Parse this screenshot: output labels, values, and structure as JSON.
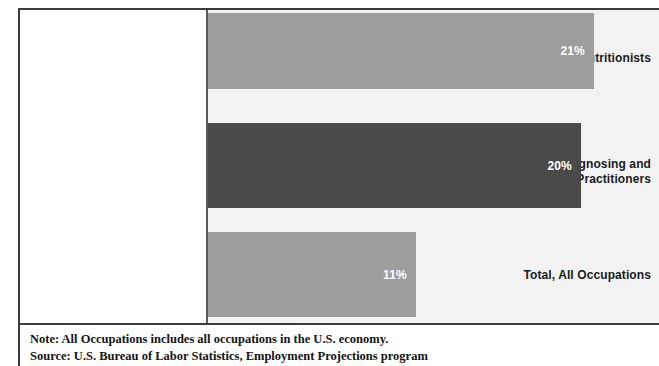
{
  "chart_data": {
    "type": "bar",
    "orientation": "horizontal",
    "title": "",
    "xlabel": "",
    "ylabel": "",
    "grid": false,
    "legend": "none",
    "xlim": [
      0,
      25
    ],
    "categories": [
      "Dietitians and Nutritionists",
      "Health Diagnosing and Treating Practitioners",
      "Total, All Occupations"
    ],
    "values": [
      21,
      20,
      11
    ],
    "value_labels": [
      "21%",
      "20%",
      "11%"
    ],
    "bar_colors": [
      "#9d9d9d",
      "#4a4a4a",
      "#9d9d9d"
    ],
    "value_label_color": "#ffffff"
  },
  "bars": [
    {
      "label_lines": [
        "Dietitians and Nutritionists"
      ],
      "value_label": "21%",
      "color": "#9d9d9d",
      "width_px": 386
    },
    {
      "label_lines": [
        "Health Diagnosing and",
        "Treating Practitioners"
      ],
      "value_label": "20%",
      "color": "#4a4a4a",
      "width_px": 373
    },
    {
      "label_lines": [
        "Total, All Occupations"
      ],
      "value_label": "11%",
      "color": "#9d9d9d",
      "width_px": 208
    }
  ],
  "footer": {
    "note": "Note: All Occupations includes all occupations in the U.S. economy.",
    "source": "Source: U.S. Bureau of Labor Statistics, Employment Projections program"
  },
  "colors": {
    "light_bar": "#9d9d9d",
    "dark_bar": "#4a4a4a",
    "plot_background": "#f2f2f2",
    "frame": "#3c3c3c",
    "text": "#1a1a1a"
  }
}
